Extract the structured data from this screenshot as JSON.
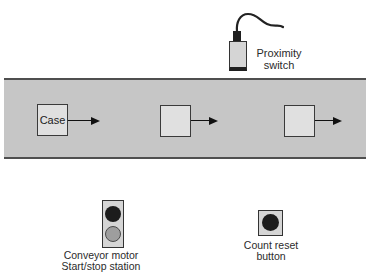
{
  "colors": {
    "background": "#ffffff",
    "belt_fill": "#c6c6c6",
    "belt_edge": "#4f4f4f",
    "case_fill": "#e0e0e0",
    "panel_fill": "#d5d5d5",
    "outline": "#333333",
    "dark_button": "#1c1c1c",
    "gray_button": "#9e9e9e",
    "cable": "#222222",
    "arrow": "#111111",
    "text": "#2b2b2b"
  },
  "proximity_switch": {
    "label_line1": "Proximity",
    "label_line2": "switch"
  },
  "conveyor": {
    "cases": [
      {
        "label": "Case"
      },
      {
        "label": ""
      },
      {
        "label": ""
      }
    ]
  },
  "start_stop_station": {
    "label_line1": "Conveyor motor",
    "label_line2": "Start/stop station"
  },
  "count_reset_button": {
    "label_line1": "Count reset",
    "label_line2": "button"
  }
}
